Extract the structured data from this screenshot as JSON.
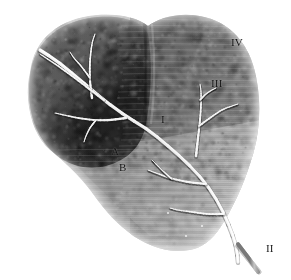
{
  "figure": {
    "type": "anatomical-illustration",
    "width": 291,
    "height": 280,
    "background_color": "#ffffff"
  },
  "palette": {
    "background": "#ffffff",
    "left_lobe_dark": "#262626",
    "left_lobe_core": "#1d1d1d",
    "left_lobe_edge": "#4a4a4a",
    "right_lobe_mid": "#6e6e6e",
    "right_lobe_light": "#8f8f8f",
    "inferior_region": "#9b9b9b",
    "fissure_line": "#3a3a3a",
    "vessel_light": "#ededed",
    "vessel_highlight": "#fafafa",
    "vessel_shadow": "#9a9a9a",
    "label_color": "#121212"
  },
  "regions": [
    {
      "id": "left-lobe",
      "name": "left-lobe",
      "tone": "#262626",
      "description": "large dark rounded lobe occupying upper-left"
    },
    {
      "id": "right-lobe",
      "name": "right-lobe",
      "tone": "#6e6e6e",
      "description": "mid-gray lobe occupying upper-right"
    },
    {
      "id": "inferior-lobe",
      "name": "inferior-lobe",
      "tone": "#9b9b9b",
      "description": "light gray inferior extension toward lower-right"
    }
  ],
  "labels": [
    {
      "id": "label-iv",
      "text": "IV",
      "x": 231,
      "y": 37,
      "on_light": false
    },
    {
      "id": "label-iii",
      "text": "III",
      "x": 211,
      "y": 78,
      "on_light": false
    },
    {
      "id": "label-i",
      "text": "I",
      "x": 161,
      "y": 114,
      "on_light": false
    },
    {
      "id": "label-a",
      "text": "A",
      "x": 111,
      "y": 146,
      "on_light": false
    },
    {
      "id": "label-b",
      "text": "B",
      "x": 119,
      "y": 162,
      "on_light": false
    },
    {
      "id": "label-ii",
      "text": "II",
      "x": 266,
      "y": 243,
      "on_light": true
    }
  ],
  "vessels": {
    "main_trunk": {
      "name": "main-vessel-trunk",
      "description": "principal vessel running from upper-left lobe diagonally down to lower-right terminus at label II"
    },
    "branch_count": 9,
    "terminus_label": "II"
  }
}
